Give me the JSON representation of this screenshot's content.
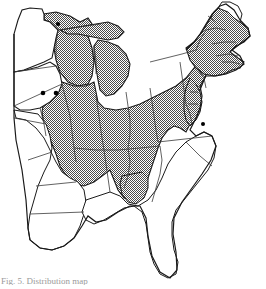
{
  "figure": {
    "type": "distribution-map",
    "region": "Eastern United States",
    "caption": "Fig. 5. Distribution map",
    "colors": {
      "shaded_fill": "#808080",
      "unshaded_fill": "#ffffff",
      "outline": "#1a1a1a",
      "state_border": "#555555",
      "dot_marker": "#000000",
      "background": "#ffffff"
    },
    "legend_semantics": {
      "shaded": "range / occurrence area",
      "dot": "isolated record locality",
      "white": "absent"
    },
    "shaded_states": [
      "Wisconsin",
      "Michigan",
      "Illinois",
      "Indiana",
      "Ohio",
      "Pennsylvania",
      "New York",
      "Vermont",
      "New Hampshire",
      "Massachusetts",
      "Connecticut",
      "Rhode Island",
      "New Jersey",
      "Delaware",
      "Maryland",
      "West Virginia",
      "Virginia",
      "Kentucky",
      "Tennessee",
      "Missouri",
      "Iowa (eastern)",
      "Maine (southern)",
      "Alabama (northern)",
      "Georgia (northern)",
      "Mississippi (northeastern)"
    ],
    "unshaded_states": [
      "Minnesota",
      "Iowa (western)",
      "Arkansas",
      "Louisiana",
      "Mississippi (southern)",
      "Alabama (southern)",
      "Georgia (southern)",
      "Florida",
      "South Carolina",
      "North Carolina",
      "Maine (northern)"
    ],
    "dot_markers": [
      {
        "label": "Minnesota record",
        "x": 58,
        "y": 24
      },
      {
        "label": "Iowa record west",
        "x": 43,
        "y": 93
      },
      {
        "label": "Iowa record east",
        "x": 56,
        "y": 93
      },
      {
        "label": "Chesapeake record",
        "x": 203,
        "y": 124
      }
    ]
  }
}
